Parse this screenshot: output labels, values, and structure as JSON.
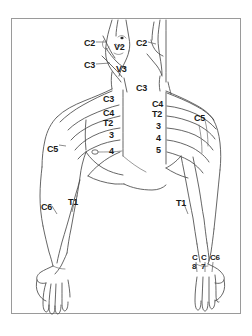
{
  "figure": {
    "view_left": "anterior",
    "view_right": "posterior",
    "frame_color": "#9a9a9a",
    "line_color": "#4a4a4a",
    "background": "#ffffff"
  },
  "labels": {
    "head_neck": [
      {
        "id": "c2-left",
        "text": "C2",
        "x": 84,
        "y": 39
      },
      {
        "id": "v2-left",
        "text": "V2",
        "x": 114,
        "y": 43
      },
      {
        "id": "c2-right",
        "text": "C2",
        "x": 136,
        "y": 39
      },
      {
        "id": "c3-left",
        "text": "C3",
        "x": 84,
        "y": 61
      },
      {
        "id": "v3-left",
        "text": "V3",
        "x": 116,
        "y": 65
      },
      {
        "id": "c3-right",
        "text": "C3",
        "x": 136,
        "y": 84
      }
    ],
    "trunk_left": [
      {
        "id": "c3-chest-left",
        "text": "C3",
        "x": 103,
        "y": 95
      },
      {
        "id": "c4-chest-left",
        "text": "C4",
        "x": 103,
        "y": 109
      },
      {
        "id": "t2-chest-left",
        "text": "T2",
        "x": 103,
        "y": 119
      },
      {
        "id": "t3-chest-left",
        "text": "3",
        "x": 109,
        "y": 131
      },
      {
        "id": "t4-chest-left",
        "text": "4",
        "x": 109,
        "y": 147
      }
    ],
    "trunk_right": [
      {
        "id": "c4-chest-right",
        "text": "C4",
        "x": 152,
        "y": 100
      },
      {
        "id": "t2-chest-right",
        "text": "T2",
        "x": 152,
        "y": 110
      },
      {
        "id": "t3-chest-right",
        "text": "3",
        "x": 156,
        "y": 122
      },
      {
        "id": "t4-chest-right",
        "text": "4",
        "x": 156,
        "y": 134
      },
      {
        "id": "t5-chest-right",
        "text": "5",
        "x": 156,
        "y": 146
      }
    ],
    "shoulders": [
      {
        "id": "c5-left",
        "text": "C5",
        "x": 47,
        "y": 145
      },
      {
        "id": "c5-right",
        "text": "C5",
        "x": 194,
        "y": 114
      }
    ],
    "arms": [
      {
        "id": "c6-left-arm",
        "text": "C6",
        "x": 41,
        "y": 203
      },
      {
        "id": "t1-left-arm",
        "text": "T1",
        "x": 68,
        "y": 198
      },
      {
        "id": "t1-right-arm",
        "text": "T1",
        "x": 176,
        "y": 199
      }
    ],
    "right_hand": [
      {
        "id": "c8-hand",
        "text": "C",
        "sub": "8",
        "x": 192,
        "y": 257
      },
      {
        "id": "c7-hand",
        "text": "C",
        "sub": "7",
        "x": 201,
        "y": 257
      },
      {
        "id": "c6-hand",
        "text": "C6",
        "sub": "",
        "x": 211,
        "y": 257
      }
    ]
  },
  "dermatome_levels": {
    "cervical": [
      "C2",
      "C3",
      "C4",
      "C5",
      "C6",
      "C7",
      "C8"
    ],
    "thoracic": [
      "T1",
      "T2",
      "T3",
      "T4",
      "T5"
    ],
    "trigeminal": [
      "V2",
      "V3"
    ]
  }
}
